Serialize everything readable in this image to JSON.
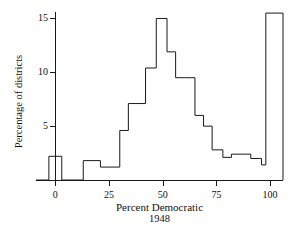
{
  "chart_data": {
    "type": "bar",
    "title": "",
    "xlabel": "Percent Democratic",
    "xlabel_sub": "1948",
    "ylabel": "Percentage of districts",
    "xlim": [
      -9,
      106
    ],
    "ylim": [
      0,
      15.6
    ],
    "grid": false,
    "legend": null,
    "bin_width": 4,
    "x_ticks": [
      0,
      25,
      50,
      75,
      100
    ],
    "x_tick_labels": [
      "0",
      "25",
      "50",
      "75",
      "100"
    ],
    "y_ticks": [
      5,
      10,
      15
    ],
    "y_tick_labels": [
      "5",
      "10",
      "15"
    ],
    "bins": [
      {
        "x0": -9,
        "x1": -3,
        "value": 0.0
      },
      {
        "x0": -3,
        "x1": 3,
        "value": 2.2
      },
      {
        "x0": 3,
        "x1": 13,
        "value": 0.0
      },
      {
        "x0": 13,
        "x1": 21,
        "value": 1.8
      },
      {
        "x0": 21,
        "x1": 30,
        "value": 1.2
      },
      {
        "x0": 30,
        "x1": 34,
        "value": 4.6
      },
      {
        "x0": 34,
        "x1": 42,
        "value": 7.1
      },
      {
        "x0": 42,
        "x1": 47,
        "value": 10.4
      },
      {
        "x0": 47,
        "x1": 52,
        "value": 15.0
      },
      {
        "x0": 52,
        "x1": 56,
        "value": 11.9
      },
      {
        "x0": 56,
        "x1": 60,
        "value": 9.5
      },
      {
        "x0": 60,
        "x1": 65,
        "value": 9.5
      },
      {
        "x0": 65,
        "x1": 69,
        "value": 6.0
      },
      {
        "x0": 69,
        "x1": 73,
        "value": 5.0
      },
      {
        "x0": 73,
        "x1": 78,
        "value": 2.8
      },
      {
        "x0": 78,
        "x1": 82,
        "value": 2.1
      },
      {
        "x0": 82,
        "x1": 87,
        "value": 2.4
      },
      {
        "x0": 87,
        "x1": 91,
        "value": 2.4
      },
      {
        "x0": 91,
        "x1": 96,
        "value": 2.0
      },
      {
        "x0": 96,
        "x1": 98,
        "value": 1.4
      },
      {
        "x0": 98,
        "x1": 106,
        "value": 15.5
      }
    ],
    "line_color": "#1a1a1a",
    "fill_color": "#ffffff",
    "axis_color": "#1a1a1a",
    "background_color": "#ffffff"
  }
}
